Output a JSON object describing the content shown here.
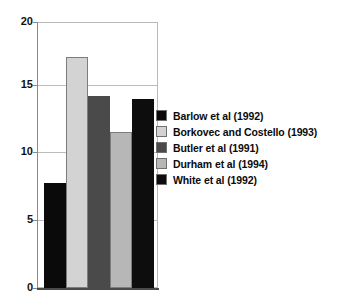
{
  "chart_data": {
    "type": "bar",
    "title": "",
    "subtitle": "",
    "xlabel": "",
    "ylabel": "",
    "ylim": [
      0,
      20
    ],
    "yticks": [
      0,
      5,
      10,
      15,
      20
    ],
    "ytick_labels": [
      "0",
      "5",
      "10",
      "15",
      "20"
    ],
    "grid": true,
    "legend_position": "right",
    "categories": [
      "Barlow et al (1992)",
      "Borkovec and Costello (1993)",
      "Butler et al (1991)",
      "Durham et al (1994)",
      "White et al (1992)"
    ],
    "values": [
      7.9,
      17.4,
      14.4,
      11.7,
      14.2
    ],
    "colors": [
      "#0a0a0a",
      "#d3d3d3",
      "#4a4a4a",
      "#b7b7b7",
      "#0d0d0d"
    ],
    "series": [
      {
        "name": "",
        "values": [
          7.9,
          17.4,
          14.4,
          11.7,
          14.2
        ]
      }
    ]
  },
  "legend": {
    "entries": [
      {
        "label": "Barlow et al (1992)",
        "color": "#0a0a0a"
      },
      {
        "label": "Borkovec and Costello (1993)",
        "color": "#d3d3d3"
      },
      {
        "label": "Butler et al (1991)",
        "color": "#4a4a4a"
      },
      {
        "label": "Durham et al (1994)",
        "color": "#b7b7b7"
      },
      {
        "label": "White et al (1992)",
        "color": "#0d0d0d"
      }
    ]
  },
  "axis": {
    "y_labels": [
      "20",
      "15",
      "10",
      "5",
      "0"
    ]
  }
}
